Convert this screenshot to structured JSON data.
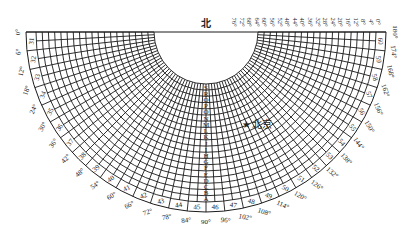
{
  "diagram": {
    "north_label": "北",
    "city_label": "北京",
    "city_marker": "star",
    "geometry": {
      "cx": 206,
      "cy": 32,
      "r_inner": 52,
      "r_grid": 170,
      "r_band": 180
    },
    "ring_letters": [
      "S",
      "R",
      "Q",
      "P",
      "O",
      "N",
      "M",
      "L",
      "K",
      "J",
      "I",
      "H",
      "G",
      "F",
      "E",
      "D",
      "C",
      "B",
      "A"
    ],
    "band_numbers": [
      31,
      32,
      33,
      34,
      35,
      36,
      37,
      38,
      39,
      40,
      41,
      42,
      43,
      44,
      45,
      46,
      47,
      48,
      49,
      50,
      51,
      52,
      53,
      54,
      55,
      56,
      57,
      58,
      59,
      60
    ],
    "outer_degree_labels": [
      "0°",
      "6°",
      "12°",
      "18°",
      "24°",
      "30°",
      "36°",
      "42°",
      "48°",
      "54°",
      "60°",
      "66°",
      "72°",
      "78°",
      "84°",
      "90°",
      "96°",
      "102°",
      "108°",
      "114°",
      "120°",
      "126°",
      "132°",
      "138°",
      "144°",
      "150°",
      "156°",
      "162°",
      "168°",
      "174°",
      "180°"
    ],
    "top_degree_labels": [
      "76°",
      "72°",
      "68°",
      "64°",
      "60°",
      "56°",
      "52°",
      "48°",
      "44°",
      "40°",
      "36°",
      "32°",
      "28°",
      "24°",
      "20°",
      "16°",
      "12°",
      "8°",
      "4°",
      "0°"
    ],
    "line_color": "#1a1a1a"
  }
}
